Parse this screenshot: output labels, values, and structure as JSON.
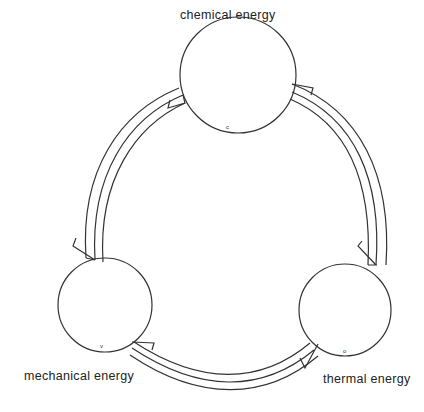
{
  "diagram": {
    "type": "cycle",
    "nodes": [
      {
        "id": "chemical",
        "label": "chemical energy",
        "marker": "c"
      },
      {
        "id": "mechanical",
        "label": "mechanical energy",
        "marker": "v"
      },
      {
        "id": "thermal",
        "label": "thermal energy",
        "marker": "o"
      }
    ],
    "edges": [
      {
        "from": "chemical",
        "to": "mechanical",
        "side": "left"
      },
      {
        "from": "mechanical",
        "to": "chemical",
        "side": "left"
      },
      {
        "from": "chemical",
        "to": "thermal",
        "side": "right"
      },
      {
        "from": "thermal",
        "to": "chemical",
        "side": "right"
      },
      {
        "from": "mechanical",
        "to": "thermal",
        "side": "bottom"
      },
      {
        "from": "thermal",
        "to": "mechanical",
        "side": "bottom"
      }
    ],
    "colors": {
      "stroke": "#333333",
      "background": "#ffffff"
    }
  }
}
